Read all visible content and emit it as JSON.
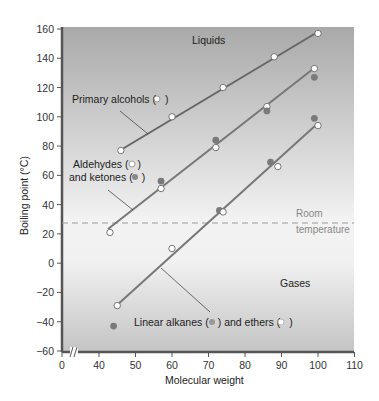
{
  "chart_data": {
    "type": "scatter",
    "title": "",
    "xlabel": "Molecular weight",
    "ylabel": "Boiling point (°C)",
    "xlim": [
      0,
      110
    ],
    "ylim": [
      -60,
      160
    ],
    "x_axis_break": "between 0 and 40",
    "xticks": [
      "0",
      "40",
      "50",
      "60",
      "70",
      "80",
      "90",
      "100",
      "110"
    ],
    "yticks": [
      "160",
      "140",
      "120",
      "100",
      "80",
      "60",
      "40",
      "20",
      "0",
      "−20",
      "−40",
      "−60"
    ],
    "grid": false,
    "regions": {
      "upper": "Liquids",
      "lower": "Gases"
    },
    "reference_line": {
      "label_line1": "Room",
      "label_line2": "temperature",
      "y": 25,
      "style": "dashed"
    },
    "series": [
      {
        "name": "Primary alcohols (○)",
        "marker": "open",
        "fit_line": true,
        "points": [
          [
            46,
            77
          ],
          [
            60,
            100
          ],
          [
            74,
            120
          ],
          [
            88,
            141
          ],
          [
            100,
            157
          ]
        ]
      },
      {
        "name": "Aldehydes (○)",
        "marker": "open",
        "fit_line": true,
        "points": [
          [
            43,
            21
          ],
          [
            57,
            51
          ],
          [
            72,
            79
          ],
          [
            86,
            107
          ],
          [
            99,
            133
          ]
        ]
      },
      {
        "name": "Ketones (●)",
        "marker": "filled",
        "fit_line": false,
        "points": [
          [
            57,
            56
          ],
          [
            72,
            84
          ],
          [
            86,
            104
          ],
          [
            99,
            127
          ]
        ]
      },
      {
        "name": "Linear alkanes (●)",
        "marker": "filled",
        "fit_line": true,
        "points": [
          [
            44,
            -43
          ],
          [
            73,
            36
          ],
          [
            87,
            69
          ],
          [
            99,
            99
          ]
        ]
      },
      {
        "name": "Ethers (○)",
        "marker": "open",
        "fit_line": true,
        "points": [
          [
            45,
            -29
          ],
          [
            60,
            10
          ],
          [
            74,
            35
          ],
          [
            89,
            66
          ],
          [
            100,
            94
          ]
        ]
      }
    ],
    "annotations": [
      {
        "text": "Primary alcohols (○)"
      },
      {
        "text": "Aldehydes (○)"
      },
      {
        "text": "and ketones (●)"
      },
      {
        "text": "Linear alkanes (●) and ethers (○)"
      },
      {
        "text": "Liquids"
      },
      {
        "text": "Gases"
      }
    ]
  },
  "labels": {
    "liquids": "Liquids",
    "gases": "Gases",
    "room1": "Room",
    "room2": "temperature",
    "alcohols": "Primary alcohols (",
    "aldehydes": "Aldehydes (",
    "ketones": "and ketones (",
    "alkanes": "Linear alkanes (",
    "ethers": ") and ethers (",
    "close": ")",
    "xlabel": "Molecular weight",
    "ylabel": "Boiling point (°C)"
  }
}
